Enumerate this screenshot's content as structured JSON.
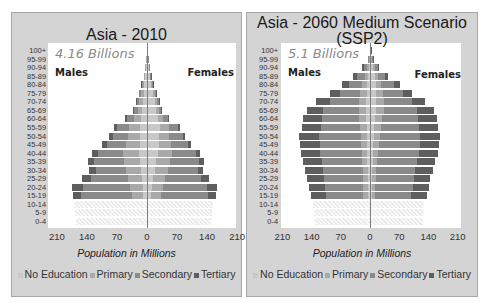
{
  "colors": {
    "no_education": "#c8c8c8",
    "primary": "#a9a9a9",
    "secondary": "#8a8a8a",
    "tertiary": "#5e5e5e",
    "panel_bg": "#d4d4d4",
    "hatch": "#eeeeee"
  },
  "legend": {
    "items": [
      {
        "label": "No Education",
        "key": "no_education"
      },
      {
        "label": "Primary",
        "key": "primary"
      },
      {
        "label": "Secondary",
        "key": "secondary"
      },
      {
        "label": "Tertiary",
        "key": "tertiary"
      }
    ]
  },
  "panels": [
    {
      "title": "Asia - 2010",
      "total": "4.16 Billions",
      "males_label": "Males",
      "females_label": "Females",
      "xlabel": "Population in Millions",
      "x_ticks": [
        "210",
        "140",
        "70",
        "0",
        "70",
        "140",
        "210"
      ]
    },
    {
      "title": "Asia - 2060  Medium Scenario",
      "title_line2": "(SSP2)",
      "total": "5.1 Billions",
      "males_label": "Males",
      "females_label": "Females",
      "xlabel": "Population in Millions",
      "x_ticks": [
        "210",
        "140",
        "70",
        "0",
        "70",
        "140",
        "210"
      ]
    }
  ],
  "chart_data": [
    {
      "type": "bar",
      "subtype": "population_pyramid_stacked",
      "title": "Asia - 2010",
      "annotation": "4.16 Billions",
      "xlabel": "Population in Millions",
      "ylabel": "",
      "xlim": [
        -210,
        210
      ],
      "x_ticks": [
        210,
        140,
        70,
        0,
        70,
        140,
        210
      ],
      "legend_position": "bottom",
      "side_labels": [
        "Males",
        "Females"
      ],
      "categories": [
        "100+",
        "95-99",
        "90-94",
        "85-89",
        "80-84",
        "75-79",
        "70-74",
        "65-69",
        "60-64",
        "55-59",
        "50-54",
        "45-49",
        "40-44",
        "35-39",
        "30-34",
        "25-29",
        "20-24",
        "15-19",
        "10-14",
        "5-9",
        "0-4"
      ],
      "note": "Ages 0-14 shown as hatched (no education breakdown). Values in millions per sex, estimated.",
      "series": [
        {
          "name": "Males",
          "values": [
            1,
            2,
            5,
            8,
            13,
            19,
            26,
            33,
            51,
            77,
            89,
            105,
            128,
            138,
            136,
            152,
            175,
            173,
            170,
            168,
            166
          ],
          "composition": {
            "No Education": [
              0.4,
              1,
              2.5,
              4,
              6,
              8,
              10,
              11,
              14,
              17,
              16,
              17,
              18,
              16,
              14,
              12,
              10,
              9,
              0,
              0,
              0
            ],
            "Primary": [
              0.3,
              0.5,
              1.2,
              2,
              4,
              6,
              8,
              10,
              16,
              24,
              28,
              33,
              38,
              37,
              34,
              32,
              30,
              26,
              0,
              0,
              0
            ],
            "Secondary": [
              0.2,
              0.4,
              1,
              1.5,
              2.5,
              4,
              6,
              9,
              16,
              28,
              35,
              44,
              58,
              70,
              72,
              86,
              110,
              118,
              0,
              0,
              0
            ],
            "Tertiary": [
              0.1,
              0.1,
              0.3,
              0.5,
              0.5,
              1,
              2,
              3,
              5,
              8,
              10,
              11,
              14,
              15,
              16,
              22,
              25,
              20,
              0,
              0,
              0
            ]
          }
        },
        {
          "name": "Females",
          "values": [
            1,
            2,
            5,
            9,
            14,
            21,
            28,
            34,
            52,
            77,
            88,
            102,
            124,
            133,
            130,
            144,
            163,
            160,
            154,
            152,
            150
          ],
          "composition": {
            "No Education": [
              0.6,
              1.3,
              3.5,
              6.5,
              10,
              14,
              18,
              20,
              25,
              30,
              28,
              27,
              26,
              22,
              18,
              15,
              12,
              10,
              0,
              0,
              0
            ],
            "Primary": [
              0.2,
              0.4,
              1,
              1.6,
              2.5,
              4,
              6,
              8,
              13,
              21,
              24,
              28,
              33,
              32,
              30,
              28,
              26,
              22,
              0,
              0,
              0
            ],
            "Secondary": [
              0.1,
              0.2,
              0.4,
              0.7,
              1.2,
              2.5,
              3.5,
              5,
              12,
              22,
              31,
              40,
              55,
              68,
              70,
              83,
              103,
              110,
              0,
              0,
              0
            ],
            "Tertiary": [
              0.1,
              0.1,
              0.1,
              0.2,
              0.3,
              0.5,
              0.5,
              1,
              2,
              4,
              5,
              7,
              10,
              11,
              12,
              18,
              22,
              18,
              0,
              0,
              0
            ]
          }
        }
      ]
    },
    {
      "type": "bar",
      "subtype": "population_pyramid_stacked",
      "title": "Asia - 2060  Medium Scenario (SSP2)",
      "annotation": "5.1 Billions",
      "xlabel": "Population in Millions",
      "ylabel": "",
      "xlim": [
        -210,
        210
      ],
      "x_ticks": [
        210,
        140,
        70,
        0,
        70,
        140,
        210
      ],
      "legend_position": "bottom",
      "side_labels": [
        "Males",
        "Females"
      ],
      "categories": [
        "100+",
        "95-99",
        "90-94",
        "85-89",
        "80-84",
        "75-79",
        "70-74",
        "65-69",
        "60-64",
        "55-59",
        "50-54",
        "45-49",
        "40-44",
        "35-39",
        "30-34",
        "25-29",
        "20-24",
        "15-19",
        "10-14",
        "5-9",
        "0-4"
      ],
      "note": "Ages 0-14 shown as hatched (no education breakdown). Values in millions per sex, estimated.",
      "series": [
        {
          "name": "Males",
          "values": [
            1,
            5,
            18,
            40,
            68,
            96,
            130,
            152,
            160,
            164,
            170,
            168,
            166,
            160,
            155,
            150,
            147,
            142,
            136,
            135,
            133
          ],
          "composition": {
            "No Education": [
              0.3,
              1,
              3,
              5,
              7,
              8,
              9,
              9,
              9,
              8,
              7,
              7,
              6,
              6,
              5,
              5,
              5,
              5,
              0,
              0,
              0
            ],
            "Primary": [
              0.3,
              1.5,
              4,
              8,
              12,
              15,
              18,
              18,
              17,
              16,
              15,
              14,
              13,
              12,
              12,
              11,
              11,
              11,
              0,
              0,
              0
            ],
            "Secondary": [
              0.3,
              1.5,
              7,
              18,
              32,
              48,
              70,
              85,
              90,
              94,
              100,
              100,
              101,
              98,
              96,
              94,
              93,
              90,
              0,
              0,
              0
            ],
            "Tertiary": [
              0.1,
              1,
              4,
              9,
              17,
              25,
              33,
              40,
              44,
              46,
              48,
              47,
              46,
              44,
              42,
              40,
              38,
              36,
              0,
              0,
              0
            ]
          }
        },
        {
          "name": "Females",
          "values": [
            2,
            7,
            22,
            44,
            72,
            100,
            133,
            153,
            160,
            164,
            168,
            166,
            163,
            157,
            151,
            145,
            142,
            137,
            130,
            129,
            127
          ],
          "composition": {
            "No Education": [
              1,
              2.5,
              7,
              11,
              14,
              15,
              15,
              14,
              12,
              10,
              9,
              8,
              7,
              6,
              5,
              5,
              4,
              4,
              0,
              0,
              0
            ],
            "Primary": [
              0.4,
              1.5,
              5,
              9,
              13,
              17,
              19,
              19,
              17,
              16,
              15,
              13,
              12,
              11,
              10,
              10,
              9,
              9,
              0,
              0,
              0
            ],
            "Secondary": [
              0.4,
              2,
              7,
              17,
              31,
              46,
              66,
              80,
              87,
              92,
              96,
              98,
              99,
              96,
              93,
              90,
              89,
              86,
              0,
              0,
              0
            ],
            "Tertiary": [
              0.2,
              1,
              3,
              7,
              14,
              22,
              33,
              40,
              44,
              46,
              48,
              47,
              45,
              44,
              43,
              40,
              40,
              38,
              0,
              0,
              0
            ]
          }
        }
      ]
    }
  ]
}
